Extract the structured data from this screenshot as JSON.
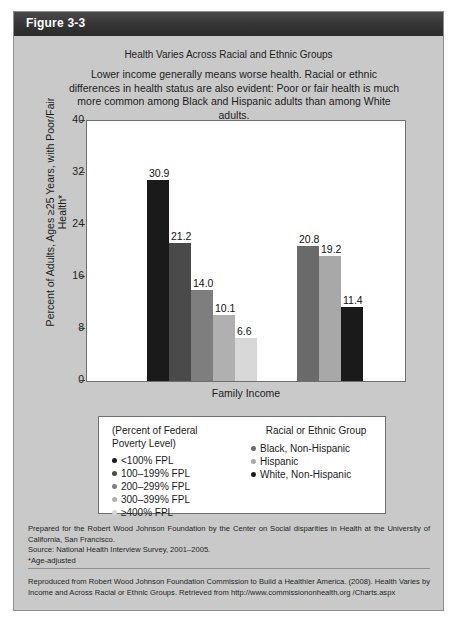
{
  "figure": {
    "header_label": "Figure 3-3"
  },
  "chart_data": {
    "type": "bar",
    "title": "Health Varies Across Racial and Ethnic Groups",
    "subtitle": "Lower income generally means worse health. Racial or ethnic differences in health status are also evident: Poor or fair health is much more common among Black and Hispanic adults than among White adults.",
    "xlabel": "Family Income",
    "ylabel": "Percent of Adults, Ages ≥25 Years, with Poor/Fair Health*",
    "ylim": [
      0,
      40
    ],
    "yticks": [
      0,
      8,
      16,
      24,
      32,
      40
    ],
    "ytick_labels": [
      "0",
      "8",
      "16",
      "24",
      "32",
      "40"
    ],
    "grid": false,
    "legend_position": "below-plot",
    "groups": [
      {
        "name": "Percent of Federal Poverty Level",
        "bars": [
          {
            "label": "<100% FPL",
            "value": 30.9,
            "value_label": "30.9",
            "color": "#1a1a1a"
          },
          {
            "label": "100–199% FPL",
            "value": 21.2,
            "value_label": "21.2",
            "color": "#4a4a4a"
          },
          {
            "label": "200–299% FPL",
            "value": 14.0,
            "value_label": "14.0",
            "color": "#7e7e7e"
          },
          {
            "label": "300–399% FPL",
            "value": 10.1,
            "value_label": "10.1",
            "color": "#b0b0b0"
          },
          {
            "label": "≥400% FPL",
            "value": 6.6,
            "value_label": "6.6",
            "color": "#d8d8d8"
          }
        ]
      },
      {
        "name": "Racial or Ethnic Group",
        "bars": [
          {
            "label": "Black, Non-Hispanic",
            "value": 20.8,
            "value_label": "20.8",
            "color": "#6a6a6a"
          },
          {
            "label": "Hispanic",
            "value": 19.2,
            "value_label": "19.2",
            "color": "#a8a8a8"
          },
          {
            "label": "White, Non-Hispanic",
            "value": 11.4,
            "value_label": "11.4",
            "color": "#1a1a1a"
          }
        ]
      }
    ]
  },
  "legend": {
    "income_heading_line1": "(Percent of Federal",
    "income_heading_line2": "Poverty Level)",
    "race_heading": "Racial or Ethnic Group",
    "income_items": [
      {
        "label": "<100% FPL",
        "color": "#1a1a1a"
      },
      {
        "label": "100–199% FPL",
        "color": "#4a4a4a"
      },
      {
        "label": "200–299% FPL",
        "color": "#7e7e7e"
      },
      {
        "label": "300–399% FPL",
        "color": "#b0b0b0"
      },
      {
        "label": "≥400% FPL",
        "color": "#d8d8d8"
      }
    ],
    "race_items": [
      {
        "label": "Black, Non-Hispanic",
        "color": "#6a6a6a"
      },
      {
        "label": "Hispanic",
        "color": "#a8a8a8"
      },
      {
        "label": "White, Non-Hispanic",
        "color": "#1a1a1a"
      }
    ]
  },
  "footnotes": {
    "prepared_by": "Prepared for the Robert Wood Johnson Foundation by the Center on Social disparities in Health at the University of California, San Francisco.",
    "source": "Source: National Health Interview Survey, 2001–2005.",
    "age_adjusted": "*Age-adjusted",
    "reproduction": "Reproduced from Robert Wood Johnson Foundation Commission to Build a Healthier America. (2008). Health Varies by Income and Across Racial or Ethnic Groups. Retrieved from http://www.commissiononhealth.org /Charts.aspx"
  }
}
